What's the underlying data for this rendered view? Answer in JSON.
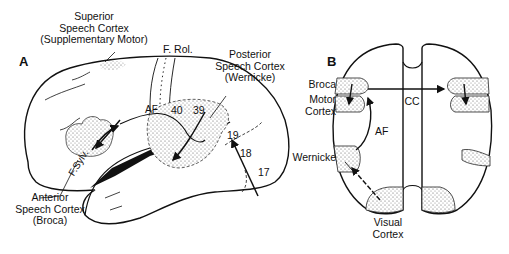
{
  "panels": {
    "A": {
      "letter": "A",
      "labels": {
        "superior_l1": "Superior",
        "superior_l2": "Speech Cortex",
        "superior_l3": "(Supplementary Motor)",
        "frol": "F. Rol.",
        "posterior_l1": "Posterior",
        "posterior_l2": "Speech Cortex",
        "posterior_l3": "(Wernicke)",
        "af": "AF",
        "fsylv": "F.Sylv.",
        "anterior_l1": "Anterior",
        "anterior_l2": "Speech Cortex",
        "anterior_l3": "(Broca)"
      },
      "areas": [
        "40",
        "39",
        "19",
        "18",
        "17"
      ]
    },
    "B": {
      "letter": "B",
      "labels": {
        "broca": "Broca",
        "motor_l1": "Motor",
        "motor_l2": "Cortex",
        "cc": "CC",
        "af": "AF",
        "wernicke": "Wernicke",
        "visual_l1": "Visual",
        "visual_l2": "Cortex"
      }
    }
  },
  "colors": {
    "ink": "#111111",
    "stipple": "#9a9a9a",
    "background": "#ffffff"
  }
}
